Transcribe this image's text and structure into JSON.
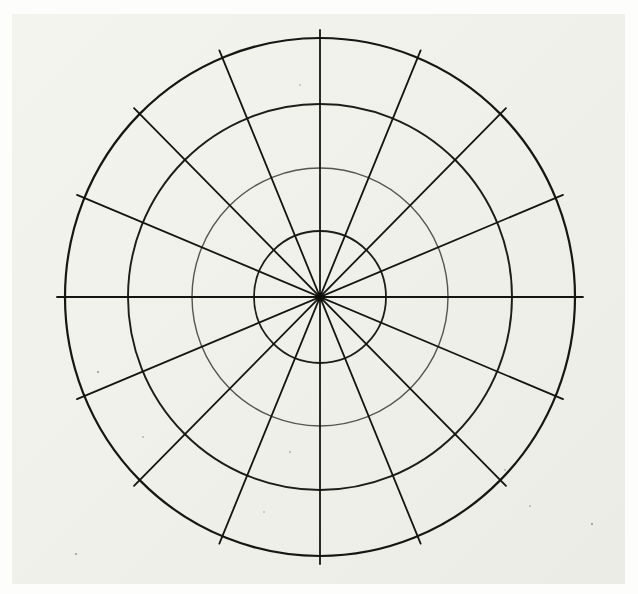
{
  "diagram": {
    "title": "",
    "type": "polar-grid",
    "center": {
      "x": 320,
      "y": 297
    },
    "rings": [
      {
        "name": "ring-1",
        "rx": 66,
        "ry": 66,
        "stroke": "#1c1c1a",
        "width": 1.8
      },
      {
        "name": "ring-2",
        "rx": 128,
        "ry": 129,
        "stroke": "#55554f",
        "width": 1.4
      },
      {
        "name": "ring-3",
        "rx": 192,
        "ry": 193,
        "stroke": "#1c1c1a",
        "width": 1.9
      },
      {
        "name": "ring-4",
        "rx": 255,
        "ry": 259,
        "stroke": "#161614",
        "width": 2.2
      }
    ],
    "spoke_count": 16,
    "spoke_angle_step_deg": 22.5,
    "spoke_color": "#141412",
    "spoke_width": 1.8,
    "spoke_overhang": 8,
    "paper_color": "#f2f2ed",
    "background_color": "#fdfdfb",
    "labels": []
  }
}
